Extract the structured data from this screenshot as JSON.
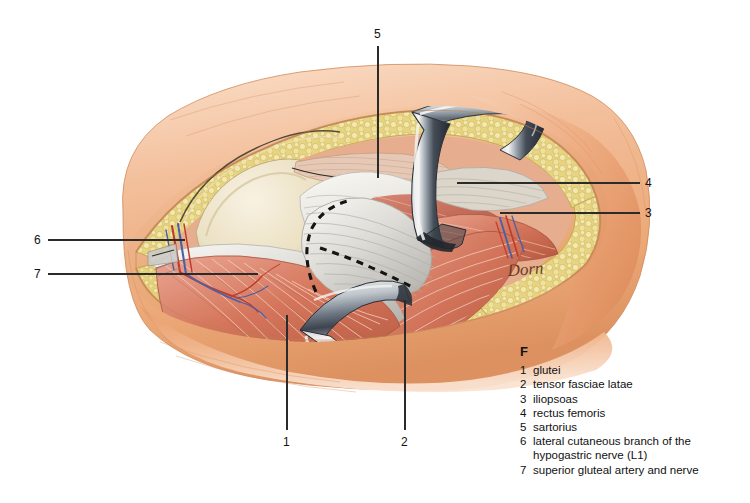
{
  "figure": {
    "label": "F",
    "signature": "Dorn",
    "background_color": "#ffffff"
  },
  "palette": {
    "skin_light": "#f6cdae",
    "skin_mid": "#eeab7f",
    "skin_deep": "#e08f5f",
    "skin_shadow": "#cf7b4c",
    "fat_light": "#f3e7a8",
    "fat_mid": "#e8d487",
    "fat_deep": "#d4bc63",
    "bone_light": "#f6f0de",
    "bone_mid": "#e6dcba",
    "bone_shadow": "#cdbf93",
    "muscle_light": "#e4907f",
    "muscle_mid": "#d2705d",
    "muscle_deep": "#b25442",
    "fascia_light": "#f2f2f0",
    "fascia_mid": "#d8d8d6",
    "fascia_shadow": "#a9a9a7",
    "metal_light": "#f0f2f4",
    "metal_mid": "#8e9aa6",
    "metal_dark": "#3c4552",
    "artery": "#c0392b",
    "vein": "#4a5fa8",
    "incision_dash": "#111111",
    "leader_line": "#2b2b2b",
    "text": "#111111"
  },
  "callouts": [
    {
      "id": "callout-5",
      "number": "5",
      "x": 378,
      "y": 35,
      "orient": "top",
      "line": {
        "x1": 378,
        "y1": 46,
        "x2": 378,
        "y2": 178
      }
    },
    {
      "id": "callout-4",
      "number": "4",
      "x": 648,
      "y": 183,
      "orient": "right",
      "line": {
        "x1": 640,
        "y1": 183,
        "x2": 457,
        "y2": 183
      }
    },
    {
      "id": "callout-3",
      "number": "3",
      "x": 648,
      "y": 213,
      "orient": "right",
      "line": {
        "x1": 640,
        "y1": 213,
        "x2": 500,
        "y2": 213
      }
    },
    {
      "id": "callout-6",
      "number": "6",
      "x": 38,
      "y": 240,
      "orient": "left",
      "line": {
        "x1": 48,
        "y1": 240,
        "x2": 185,
        "y2": 240
      }
    },
    {
      "id": "callout-7",
      "number": "7",
      "x": 38,
      "y": 274,
      "orient": "left",
      "line": {
        "x1": 48,
        "y1": 274,
        "x2": 258,
        "y2": 274
      }
    },
    {
      "id": "callout-1",
      "number": "1",
      "x": 283,
      "y": 441,
      "orient": "bottom",
      "line": {
        "x1": 287,
        "y1": 430,
        "x2": 287,
        "y2": 315
      }
    },
    {
      "id": "callout-2",
      "number": "2",
      "x": 401,
      "y": 441,
      "orient": "bottom",
      "line": {
        "x1": 405,
        "y1": 430,
        "x2": 405,
        "y2": 300
      }
    }
  ],
  "legend": {
    "title": "F",
    "items": [
      {
        "index": "1",
        "text": "glutei"
      },
      {
        "index": "2",
        "text": "tensor fasciae latae"
      },
      {
        "index": "3",
        "text": "iliopsoas"
      },
      {
        "index": "4",
        "text": "rectus femoris"
      },
      {
        "index": "5",
        "text": "sartorius"
      },
      {
        "index": "6",
        "text": "lateral cutaneous branch of the",
        "continuation": "hypogastric nerve (L1)"
      },
      {
        "index": "7",
        "text": "superior gluteal artery and nerve"
      }
    ]
  }
}
